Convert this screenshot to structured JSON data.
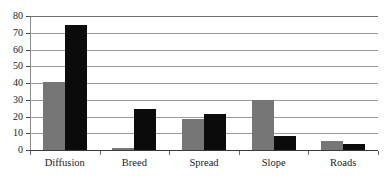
{
  "chart_data": {
    "type": "bar",
    "title": "",
    "subtitle": "",
    "xlabel": "",
    "ylabel": "",
    "categories": [
      "Diffusion",
      "Breed",
      "Spread",
      "Slope",
      "Roads"
    ],
    "series": [
      {
        "name": "Series 1",
        "color": "#767676",
        "values": [
          40.5,
          1.0,
          18.5,
          29.8,
          5.4
        ]
      },
      {
        "name": "Series 2",
        "color": "#0b0b0b",
        "values": [
          74.5,
          24.3,
          21.4,
          8.4,
          3.3
        ]
      }
    ],
    "ylim": [
      0,
      80
    ],
    "yticks": [
      0,
      10,
      20,
      30,
      40,
      50,
      60,
      70,
      80
    ],
    "ytick_labels": [
      "0",
      "10",
      "20",
      "30",
      "40",
      "50",
      "60",
      "70",
      "80"
    ],
    "grid": true,
    "grid_axis": "y",
    "legend": false,
    "legend_position": "none"
  },
  "colors": {
    "series1": "#767676",
    "series2": "#0b0b0b",
    "grid": "#9a9a9a",
    "axis": "#4a4a4a",
    "text": "#1b1b1b",
    "background": "#ffffff"
  }
}
